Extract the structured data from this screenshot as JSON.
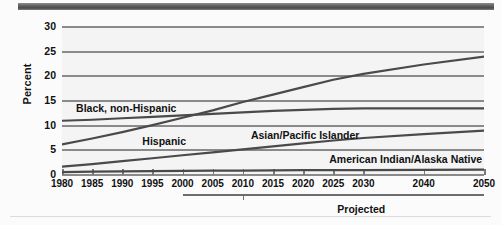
{
  "chart_data": {
    "type": "line",
    "title": "",
    "subtitle": "",
    "xlabel": "",
    "ylabel": "Percent",
    "xlim": [
      1980,
      2050
    ],
    "ylim": [
      0,
      30
    ],
    "ytick_values": [
      0,
      5,
      10,
      15,
      20,
      25,
      30
    ],
    "ytick_labels": [
      "0",
      "5",
      "10",
      "15",
      "20",
      "25",
      "30"
    ],
    "xtick_values": [
      1980,
      1985,
      1990,
      1995,
      2000,
      2005,
      2010,
      2015,
      2020,
      2025,
      2030,
      2040,
      2050
    ],
    "xtick_labels": [
      "1980",
      "1985",
      "1990",
      "1995",
      "2000",
      "2005",
      "2010",
      "2015",
      "2020",
      "2025",
      "2030",
      "2040",
      "2050"
    ],
    "grid": true,
    "legend_position": "inline-labels",
    "annotations": [
      {
        "text": "Projected",
        "x_start": 2000,
        "x_end": 2050,
        "tick_at": 2010
      }
    ],
    "series": [
      {
        "name": "Black, non-Hispanic",
        "label_x": 1982,
        "label_y": 13.3,
        "color": "#4a4a4a",
        "x": [
          1980,
          1985,
          1990,
          1995,
          2000,
          2005,
          2010,
          2015,
          2020,
          2025,
          2030,
          2040,
          2050
        ],
        "values": [
          11.0,
          11.2,
          11.5,
          11.8,
          12.1,
          12.4,
          12.7,
          13.0,
          13.2,
          13.4,
          13.5,
          13.5,
          13.5
        ]
      },
      {
        "name": "Hispanic",
        "label_x": 1993,
        "label_y": 6.6,
        "color": "#4a4a4a",
        "x": [
          1980,
          1985,
          1990,
          1995,
          2000,
          2005,
          2010,
          2015,
          2020,
          2025,
          2030,
          2040,
          2050
        ],
        "values": [
          6.2,
          7.4,
          8.7,
          10.1,
          11.6,
          13.1,
          14.8,
          16.3,
          17.8,
          19.3,
          20.5,
          22.4,
          24.0
        ]
      },
      {
        "name": "Asian/Pacific Islander",
        "label_x": 2011,
        "label_y": 8.0,
        "color": "#4a4a4a",
        "x": [
          1980,
          1985,
          1990,
          1995,
          2000,
          2005,
          2010,
          2015,
          2020,
          2025,
          2030,
          2040,
          2050
        ],
        "values": [
          1.7,
          2.2,
          2.8,
          3.4,
          4.0,
          4.6,
          5.2,
          5.8,
          6.4,
          7.0,
          7.5,
          8.3,
          9.0
        ]
      },
      {
        "name": "American Indian/Alaska Native",
        "label_x": 2024,
        "label_y": 3.1,
        "color": "#4a4a4a",
        "x": [
          1980,
          1985,
          1990,
          1995,
          2000,
          2005,
          2010,
          2015,
          2020,
          2025,
          2030,
          2040,
          2050
        ],
        "values": [
          0.6,
          0.7,
          0.75,
          0.8,
          0.85,
          0.9,
          0.9,
          0.95,
          1.0,
          1.0,
          1.0,
          1.05,
          1.1
        ]
      }
    ]
  },
  "axis": {
    "y_title": "Percent"
  },
  "footer": {
    "projected_label": "Projected"
  }
}
